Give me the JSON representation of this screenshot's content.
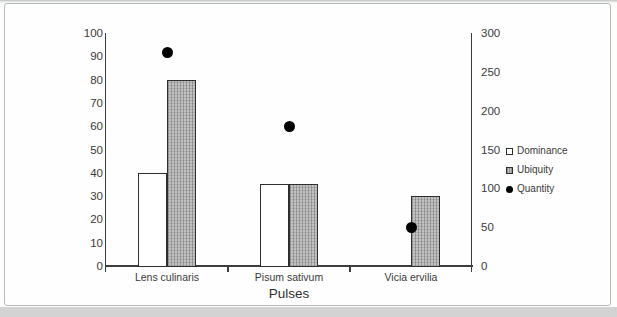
{
  "chart_data": {
    "type": "bar",
    "title": "",
    "xlabel": "Pulses",
    "categories": [
      "Lens culinaris",
      "Pisum sativum",
      "Vicia ervilia"
    ],
    "series": [
      {
        "name": "Dominance",
        "kind": "bar",
        "axis": "left",
        "values": [
          40,
          35,
          0
        ],
        "fill": "#ffffff",
        "marker": "open-square"
      },
      {
        "name": "Ubiquity",
        "kind": "bar",
        "axis": "left",
        "values": [
          80,
          35,
          30
        ],
        "fill": "#bdbdbd",
        "marker": "pattern-square"
      },
      {
        "name": "Quantity",
        "kind": "scatter",
        "axis": "right",
        "values": [
          275,
          180,
          50
        ],
        "fill": "#000000",
        "marker": "dot"
      }
    ],
    "left_axis": {
      "min": 0,
      "max": 100,
      "step": 10,
      "tick_labels": [
        "0",
        "10",
        "20",
        "30",
        "40",
        "50",
        "60",
        "70",
        "80",
        "90",
        "100"
      ]
    },
    "right_axis": {
      "min": 0,
      "max": 300,
      "step": 50,
      "tick_labels": [
        "0",
        "50",
        "100",
        "150",
        "200",
        "250",
        "300"
      ]
    },
    "legend": {
      "position": "right",
      "entries": [
        {
          "label": "Dominance",
          "marker": "open-square"
        },
        {
          "label": "Ubiquity",
          "marker": "pattern-square"
        },
        {
          "label": "Quantity",
          "marker": "dot"
        }
      ]
    },
    "grid": false,
    "colors": {
      "bar_border": "#2e2e2e",
      "axis_line": "#3c3c3c",
      "text": "#3a3a3a",
      "ubiquity_fill": "#bdbdbd",
      "quantity_dot": "#000000",
      "frame_border": "#b4babc"
    }
  }
}
